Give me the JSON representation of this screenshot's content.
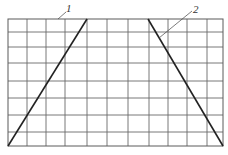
{
  "diagram": {
    "type": "grid-with-lines",
    "grid": {
      "left": 8,
      "top": 19,
      "right": 223,
      "bottom": 146,
      "vertical_lines_x": [
        27,
        46,
        65,
        87,
        107,
        128,
        149,
        168,
        187,
        207
      ],
      "horizontal_lines_y": [
        32,
        47,
        63,
        81,
        98,
        115,
        132
      ],
      "color": "#6a6a6a"
    },
    "lines": [
      {
        "id": "1",
        "x1": 8,
        "y1": 146,
        "x2": 87,
        "y2": 19,
        "color": "#222222"
      },
      {
        "id": "2",
        "x1": 148,
        "y1": 19,
        "x2": 223,
        "y2": 146,
        "color": "#222222"
      }
    ],
    "labels": [
      {
        "text": "1",
        "x": 66,
        "y": 12,
        "leader": {
          "x1": 58,
          "y1": 19,
          "x2": 66,
          "y2": 12
        }
      },
      {
        "text": "2",
        "x": 193,
        "y": 13,
        "leader": {
          "x1": 159,
          "y1": 38,
          "x2": 192,
          "y2": 11
        }
      }
    ]
  }
}
